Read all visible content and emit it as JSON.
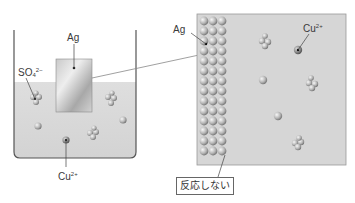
{
  "beaker": {
    "electrode_label": "Ag",
    "sulfate_label": {
      "base": "SO",
      "sub": "4",
      "sup": "2−"
    },
    "copper_label": {
      "base": "Cu",
      "sup": "2+"
    }
  },
  "magnified": {
    "metal_label": "Ag",
    "copper_label": {
      "base": "Cu",
      "sup": "2+"
    },
    "result_label": "反応しない"
  },
  "colors": {
    "solution": "#d9d9d9",
    "beaker_line": "#555555",
    "plate_light": "#e6e6e6",
    "plate_dark": "#9a9a9a",
    "zoom_bg": "#d6d6d6",
    "sphere_light": "#f0f0f0",
    "sphere_dark": "#7a7a7a"
  }
}
